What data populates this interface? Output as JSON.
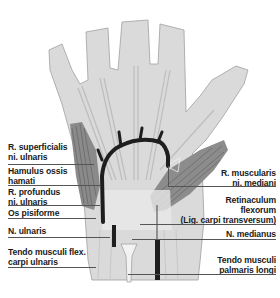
{
  "figure": {
    "colors": {
      "skin": "#d9d9d9",
      "outline": "#9a9a9a",
      "nerve": "#1e1e1e",
      "muscle": "#7a7a7a",
      "tendon": "#eeeeee",
      "leader": "#555555",
      "text": "#1a1a1a"
    }
  },
  "labels": {
    "left": [
      {
        "id": "r-superficialis",
        "lines": [
          "R. superficialis",
          "ni. ulnaris"
        ]
      },
      {
        "id": "hamulus",
        "lines": [
          "Hamulus ossis",
          "hamati"
        ]
      },
      {
        "id": "r-profundus",
        "lines": [
          "R. profundus",
          "ni. ulnaris"
        ]
      },
      {
        "id": "os-pisiforme",
        "lines": [
          "Os pisiforme"
        ]
      },
      {
        "id": "n-ulnaris",
        "lines": [
          "N. ulnaris"
        ]
      },
      {
        "id": "tendo-fcu",
        "lines": [
          "Tendo musculi flex.",
          "carpi ulnaris"
        ]
      }
    ],
    "right": [
      {
        "id": "r-muscularis",
        "lines": [
          "R. muscularis",
          "ni. mediani"
        ]
      },
      {
        "id": "retinaculum",
        "lines": [
          "Retinaculum",
          "flexorum",
          "(Lig. carpi transversum)"
        ]
      },
      {
        "id": "n-medianus",
        "lines": [
          "N. medianus"
        ]
      },
      {
        "id": "tendo-pl",
        "lines": [
          "Tendo musculi",
          "palmaris longi"
        ]
      }
    ]
  }
}
